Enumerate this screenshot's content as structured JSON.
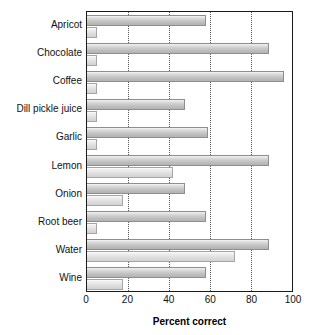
{
  "chart_data": {
    "type": "bar",
    "orientation": "horizontal",
    "title": "",
    "xlabel": "Percent correct",
    "ylabel": "",
    "xlim": [
      0,
      100
    ],
    "xticks": [
      0,
      20,
      40,
      60,
      80,
      100
    ],
    "gridlines": [
      20,
      40,
      60,
      80
    ],
    "grid": true,
    "legend": "none",
    "categories": [
      "Apricot",
      "Chocolate",
      "Coffee",
      "Dill pickle juice",
      "Garlic",
      "Lemon",
      "Onion",
      "Root beer",
      "Water",
      "Wine"
    ],
    "series": [
      {
        "name": "upper",
        "values": [
          58,
          89,
          96,
          48,
          59,
          89,
          48,
          58,
          89,
          58
        ]
      },
      {
        "name": "lower",
        "values": [
          5,
          5,
          5,
          5,
          5,
          42,
          17.5,
          5,
          72,
          17.5
        ]
      }
    ]
  },
  "axis": {
    "x_title": "Percent correct",
    "tick_labels": [
      "0",
      "20",
      "40",
      "60",
      "80",
      "100"
    ]
  },
  "colors": {
    "bar_fill_light": "#f2f2f2",
    "bar_fill_dark": "#b3b3b3",
    "bar_border": "#8e8e8e",
    "frame": "#1a1a1a",
    "gridline": "#555555",
    "text": "#111111",
    "background": "#ffffff"
  }
}
